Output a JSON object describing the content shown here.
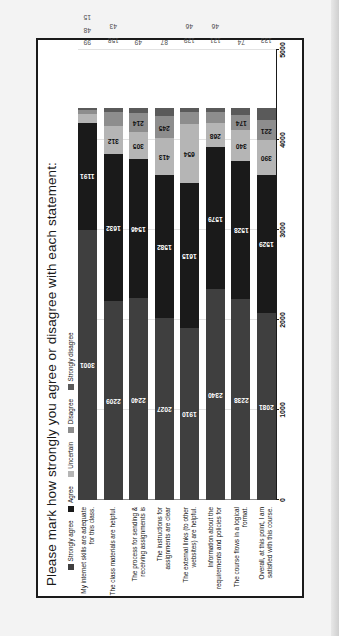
{
  "chart_data": {
    "type": "bar",
    "orientation": "horizontal-stacked",
    "title": "Please mark how strongly you agree or disagree with each statement:",
    "xlabel": "",
    "ylabel": "",
    "xlim": [
      0,
      5000
    ],
    "xticks": [
      "0",
      "1000",
      "2000",
      "3000",
      "4000",
      "5000"
    ],
    "grid": true,
    "legend_position": "top-left",
    "legend": [
      {
        "label": "Strongly agree",
        "color": "#3f3f3f"
      },
      {
        "label": "Agree",
        "color": "#1a1a1a"
      },
      {
        "label": "Uncertain",
        "color": "#b5b5b5"
      },
      {
        "label": "Disagree",
        "color": "#8d8d8d"
      },
      {
        "label": "Strongly disagree",
        "color": "#5a5a5a"
      }
    ],
    "series": [
      {
        "name": "Strongly agree",
        "color": "#4a4a4a",
        "values": [
          3001,
          2209,
          2240,
          2027,
          1910,
          2340,
          2238,
          2081
        ]
      },
      {
        "name": "Agree",
        "color": "#1c1c1c",
        "values": [
          1191,
          1632,
          1546,
          1582,
          1615,
          1579,
          1528,
          1529
        ]
      },
      {
        "name": "Uncertain",
        "color": "#c0c0c0",
        "values": [
          99,
          312,
          305,
          413,
          654,
          268,
          340,
          390
        ]
      },
      {
        "name": "Disagree",
        "color": "#8f8f8f",
        "values": [
          48,
          158,
          214,
          245,
          129,
          121,
          174,
          221
        ]
      },
      {
        "name": "Strongly disagree",
        "color": "#5c5c5c",
        "values": [
          15,
          43,
          49,
          87,
          46,
          46,
          74,
          133
        ]
      }
    ],
    "categories": [
      "My internet skills are adequate for this class.",
      "The class materials are helpful.",
      "The process for sending & receiving assignments is",
      "The instructions for assignments are clear",
      "The external links (to other websites) are helpful.",
      "Information about the requirements and policies for",
      "The course flows in a logical format.",
      "Overall, at this point, I am satisfied with this course."
    ],
    "bars": [
      {
        "category": "My internet skills are adequate for this class.",
        "segments": [
          {
            "series": "Strongly agree",
            "value": 3001,
            "label": "3001",
            "inside": true
          },
          {
            "series": "Agree",
            "value": 1191,
            "label": "1191",
            "inside": true
          },
          {
            "series": "Uncertain",
            "value": 99,
            "label": "99",
            "inside": false
          },
          {
            "series": "Disagree",
            "value": 48,
            "label": "48",
            "inside": false
          },
          {
            "series": "Strongly disagree",
            "value": 15,
            "label": "15",
            "inside": false
          }
        ]
      },
      {
        "category": "The class materials are helpful.",
        "segments": [
          {
            "series": "Strongly agree",
            "value": 2209,
            "label": "2209",
            "inside": true
          },
          {
            "series": "Agree",
            "value": 1632,
            "label": "1632",
            "inside": true
          },
          {
            "series": "Uncertain",
            "value": 312,
            "label": "312",
            "inside": true
          },
          {
            "series": "Disagree",
            "value": 158,
            "label": "158",
            "inside": false
          },
          {
            "series": "Strongly disagree",
            "value": 43,
            "label": "43",
            "inside": false
          }
        ]
      },
      {
        "category": "The process for sending & receiving assignments is",
        "segments": [
          {
            "series": "Strongly agree",
            "value": 2240,
            "label": "2240",
            "inside": true
          },
          {
            "series": "Agree",
            "value": 1546,
            "label": "1546",
            "inside": true
          },
          {
            "series": "Uncertain",
            "value": 305,
            "label": "305",
            "inside": true
          },
          {
            "series": "Disagree",
            "value": 214,
            "label": "214",
            "inside": true
          },
          {
            "series": "Strongly disagree",
            "value": 49,
            "label": "49",
            "inside": false
          }
        ]
      },
      {
        "category": "The instructions for assignments are clear",
        "segments": [
          {
            "series": "Strongly agree",
            "value": 2027,
            "label": "2027",
            "inside": true
          },
          {
            "series": "Agree",
            "value": 1582,
            "label": "1582",
            "inside": true
          },
          {
            "series": "Uncertain",
            "value": 413,
            "label": "413",
            "inside": true
          },
          {
            "series": "Disagree",
            "value": 245,
            "label": "245",
            "inside": true
          },
          {
            "series": "Strongly disagree",
            "value": 87,
            "label": "87",
            "inside": false
          }
        ]
      },
      {
        "category": "The external links (to other websites) are helpful.",
        "segments": [
          {
            "series": "Strongly agree",
            "value": 1910,
            "label": "1910",
            "inside": true
          },
          {
            "series": "Agree",
            "value": 1615,
            "label": "1615",
            "inside": true
          },
          {
            "series": "Uncertain",
            "value": 654,
            "label": "654",
            "inside": true
          },
          {
            "series": "Disagree",
            "value": 129,
            "label": "129",
            "inside": false
          },
          {
            "series": "Strongly disagree",
            "value": 46,
            "label": "46",
            "inside": false
          }
        ]
      },
      {
        "category": "Information about the requirements and policies for",
        "segments": [
          {
            "series": "Strongly agree",
            "value": 2340,
            "label": "2340",
            "inside": true
          },
          {
            "series": "Agree",
            "value": 1579,
            "label": "1579",
            "inside": true
          },
          {
            "series": "Uncertain",
            "value": 268,
            "label": "268",
            "inside": true
          },
          {
            "series": "Disagree",
            "value": 121,
            "label": "121",
            "inside": false
          },
          {
            "series": "Strongly disagree",
            "value": 46,
            "label": "46",
            "inside": false
          }
        ]
      },
      {
        "category": "The course flows in a logical format.",
        "segments": [
          {
            "series": "Strongly agree",
            "value": 2238,
            "label": "2238",
            "inside": true
          },
          {
            "series": "Agree",
            "value": 1528,
            "label": "1528",
            "inside": true
          },
          {
            "series": "Uncertain",
            "value": 340,
            "label": "340",
            "inside": true
          },
          {
            "series": "Disagree",
            "value": 174,
            "label": "174",
            "inside": true
          },
          {
            "series": "Strongly disagree",
            "value": 74,
            "label": "74",
            "inside": false
          }
        ]
      },
      {
        "category": "Overall, at this point, I am satisfied with this course.",
        "segments": [
          {
            "series": "Strongly agree",
            "value": 2081,
            "label": "2081",
            "inside": true
          },
          {
            "series": "Agree",
            "value": 1529,
            "label": "1529",
            "inside": true
          },
          {
            "series": "Uncertain",
            "value": 390,
            "label": "390",
            "inside": true
          },
          {
            "series": "Disagree",
            "value": 221,
            "label": "221",
            "inside": true
          },
          {
            "series": "Strongly disagree",
            "value": 133,
            "label": "133",
            "inside": false
          }
        ]
      }
    ]
  }
}
